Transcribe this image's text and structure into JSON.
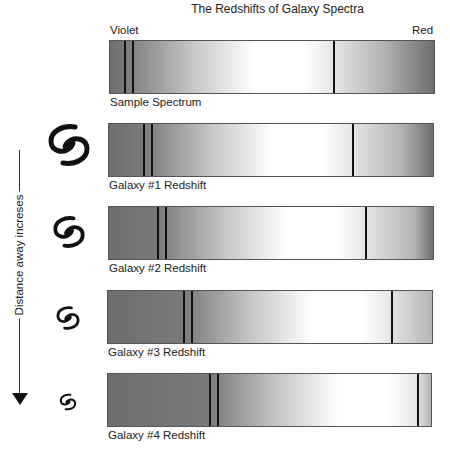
{
  "title": "The Redshifts of Galaxy Spectra",
  "axis_labels": {
    "left": "Violet",
    "right": "Red"
  },
  "arrow_label": "Distance away increses",
  "colors": {
    "line": "#111111",
    "bar_dark": "#6e6e6e",
    "bar_light": "#ffffff",
    "border": "#555555"
  },
  "spectra": [
    {
      "label": "Sample Spectrum",
      "icon": null,
      "bar": {
        "x": 109,
        "y": 40,
        "w": 326
      },
      "lines_x": [
        124,
        132,
        333
      ]
    },
    {
      "label": "Galaxy #1 Redshift",
      "icon": "spiral-galaxy-large",
      "bar": {
        "x": 108,
        "y": 123,
        "w": 326
      },
      "lines_x": [
        143,
        151,
        352
      ]
    },
    {
      "label": "Galaxy #2 Redshift",
      "icon": "spiral-galaxy-medium",
      "bar": {
        "x": 108,
        "y": 206,
        "w": 326
      },
      "lines_x": [
        157,
        165,
        365
      ]
    },
    {
      "label": "Galaxy #3 Redshift",
      "icon": "spiral-galaxy-small",
      "bar": {
        "x": 107,
        "y": 290,
        "w": 326
      },
      "lines_x": [
        183,
        191,
        391
      ]
    },
    {
      "label": "Galaxy #4 Redshift",
      "icon": "spiral-galaxy-tiny",
      "bar": {
        "x": 107,
        "y": 373,
        "w": 325
      },
      "lines_x": [
        209,
        217,
        417
      ]
    }
  ]
}
